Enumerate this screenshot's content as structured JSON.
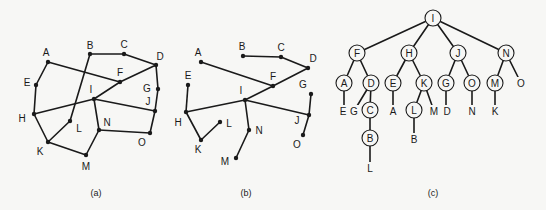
{
  "panels": [
    {
      "id": "a",
      "caption": "(a)",
      "caption_pos": [
        96,
        193
      ],
      "type": "graph",
      "nodes": {
        "A": {
          "x": 48,
          "y": 62,
          "lx": 46,
          "ly": 52
        },
        "B": {
          "x": 90,
          "y": 54,
          "lx": 90,
          "ly": 45
        },
        "C": {
          "x": 124,
          "y": 54,
          "lx": 124,
          "ly": 44
        },
        "D": {
          "x": 156,
          "y": 65,
          "lx": 160,
          "ly": 56
        },
        "E": {
          "x": 36,
          "y": 85,
          "lx": 27,
          "ly": 82
        },
        "F": {
          "x": 120,
          "y": 82,
          "lx": 120,
          "ly": 72
        },
        "G": {
          "x": 158,
          "y": 89,
          "lx": 147,
          "ly": 88
        },
        "H": {
          "x": 34,
          "y": 114,
          "lx": 22,
          "ly": 118
        },
        "I": {
          "x": 94,
          "y": 99,
          "lx": 91,
          "ly": 89
        },
        "J": {
          "x": 155,
          "y": 111,
          "lx": 148,
          "ly": 101
        },
        "K": {
          "x": 48,
          "y": 142,
          "lx": 40,
          "ly": 151
        },
        "L": {
          "x": 70,
          "y": 121,
          "lx": 79,
          "ly": 128
        },
        "M": {
          "x": 86,
          "y": 155,
          "lx": 86,
          "ly": 166
        },
        "N": {
          "x": 99,
          "y": 130,
          "lx": 107,
          "ly": 122
        },
        "O": {
          "x": 150,
          "y": 133,
          "lx": 142,
          "ly": 142
        }
      },
      "edges": [
        [
          "A",
          "E"
        ],
        [
          "E",
          "H"
        ],
        [
          "H",
          "K"
        ],
        [
          "K",
          "M"
        ],
        [
          "M",
          "N"
        ],
        [
          "N",
          "O"
        ],
        [
          "O",
          "J"
        ],
        [
          "J",
          "G"
        ],
        [
          "G",
          "D"
        ],
        [
          "D",
          "C"
        ],
        [
          "C",
          "B"
        ],
        [
          "B",
          "L"
        ],
        [
          "L",
          "K"
        ],
        [
          "A",
          "F"
        ],
        [
          "H",
          "I"
        ],
        [
          "I",
          "F"
        ],
        [
          "F",
          "D"
        ],
        [
          "I",
          "J"
        ],
        [
          "I",
          "N"
        ]
      ]
    },
    {
      "id": "b",
      "caption": "(b)",
      "caption_pos": [
        246,
        193
      ],
      "type": "spanning-tree",
      "nodes": {
        "A": {
          "x": 201,
          "y": 62,
          "lx": 198,
          "ly": 52
        },
        "B": {
          "x": 243,
          "y": 56,
          "lx": 242,
          "ly": 46
        },
        "C": {
          "x": 281,
          "y": 57,
          "lx": 281,
          "ly": 47
        },
        "D": {
          "x": 308,
          "y": 68,
          "lx": 313,
          "ly": 58
        },
        "E": {
          "x": 188,
          "y": 85,
          "lx": 188,
          "ly": 75
        },
        "F": {
          "x": 273,
          "y": 86,
          "lx": 273,
          "ly": 76
        },
        "G": {
          "x": 311,
          "y": 94,
          "lx": 303,
          "ly": 84
        },
        "H": {
          "x": 186,
          "y": 112,
          "lx": 178,
          "ly": 122
        },
        "I": {
          "x": 245,
          "y": 100,
          "lx": 241,
          "ly": 90
        },
        "J": {
          "x": 309,
          "y": 115,
          "lx": 297,
          "ly": 120
        },
        "K": {
          "x": 201,
          "y": 140,
          "lx": 198,
          "ly": 149
        },
        "L": {
          "x": 220,
          "y": 122,
          "lx": 229,
          "ly": 123
        },
        "M": {
          "x": 236,
          "y": 158,
          "lx": 225,
          "ly": 161
        },
        "N": {
          "x": 249,
          "y": 130,
          "lx": 259,
          "ly": 130
        },
        "O": {
          "x": 303,
          "y": 135,
          "lx": 297,
          "ly": 144
        }
      },
      "edges": [
        [
          "B",
          "C"
        ],
        [
          "C",
          "D"
        ],
        [
          "D",
          "F"
        ],
        [
          "F",
          "A"
        ],
        [
          "F",
          "I"
        ],
        [
          "I",
          "H"
        ],
        [
          "H",
          "E"
        ],
        [
          "H",
          "K"
        ],
        [
          "K",
          "L"
        ],
        [
          "I",
          "N"
        ],
        [
          "N",
          "M"
        ],
        [
          "I",
          "J"
        ],
        [
          "J",
          "G"
        ],
        [
          "J",
          "O"
        ]
      ]
    },
    {
      "id": "c",
      "caption": "(c)",
      "caption_pos": [
        433,
        193
      ],
      "type": "tree",
      "circle_nodes": [
        {
          "label": "I",
          "x": 433,
          "y": 18
        },
        {
          "label": "F",
          "x": 357,
          "y": 53
        },
        {
          "label": "H",
          "x": 409,
          "y": 53
        },
        {
          "label": "J",
          "x": 458,
          "y": 53
        },
        {
          "label": "N",
          "x": 506,
          "y": 53
        },
        {
          "label": "A",
          "x": 344,
          "y": 83
        },
        {
          "label": "D",
          "x": 371,
          "y": 83
        },
        {
          "label": "E",
          "x": 393,
          "y": 83
        },
        {
          "label": "K",
          "x": 424,
          "y": 83
        },
        {
          "label": "G",
          "x": 446,
          "y": 83
        },
        {
          "label": "O",
          "x": 472,
          "y": 83
        },
        {
          "label": "M",
          "x": 495,
          "y": 83
        },
        {
          "label": "C",
          "x": 370,
          "y": 110
        },
        {
          "label": "L",
          "x": 414,
          "y": 110
        },
        {
          "label": "B",
          "x": 370,
          "y": 138
        }
      ],
      "leaf_nodes": [
        {
          "label": "O",
          "x": 521,
          "y": 83
        },
        {
          "label": "E",
          "x": 343,
          "y": 111
        },
        {
          "label": "G",
          "x": 354,
          "y": 111
        },
        {
          "label": "A",
          "x": 393,
          "y": 111
        },
        {
          "label": "M",
          "x": 434,
          "y": 111
        },
        {
          "label": "D",
          "x": 447,
          "y": 111
        },
        {
          "label": "N",
          "x": 472,
          "y": 111
        },
        {
          "label": "K",
          "x": 495,
          "y": 111
        },
        {
          "label": "B",
          "x": 414,
          "y": 139
        },
        {
          "label": "L",
          "x": 370,
          "y": 168
        }
      ],
      "edges": [
        [
          433,
          18,
          357,
          53
        ],
        [
          433,
          18,
          409,
          53
        ],
        [
          433,
          18,
          458,
          53
        ],
        [
          433,
          18,
          506,
          53
        ],
        [
          357,
          53,
          344,
          83
        ],
        [
          357,
          53,
          371,
          83
        ],
        [
          409,
          53,
          393,
          83
        ],
        [
          409,
          53,
          424,
          83
        ],
        [
          458,
          53,
          446,
          83
        ],
        [
          458,
          53,
          472,
          83
        ],
        [
          506,
          53,
          495,
          83
        ],
        [
          506,
          53,
          521,
          83
        ],
        [
          344,
          83,
          344,
          111
        ],
        [
          371,
          83,
          354,
          111
        ],
        [
          371,
          83,
          370,
          110
        ],
        [
          393,
          83,
          393,
          111
        ],
        [
          424,
          83,
          414,
          110
        ],
        [
          424,
          83,
          434,
          111
        ],
        [
          446,
          83,
          446,
          111
        ],
        [
          472,
          83,
          472,
          111
        ],
        [
          495,
          83,
          495,
          111
        ],
        [
          370,
          110,
          370,
          138
        ],
        [
          414,
          110,
          414,
          139
        ],
        [
          370,
          138,
          370,
          168
        ]
      ],
      "circle_radius": 8
    }
  ]
}
